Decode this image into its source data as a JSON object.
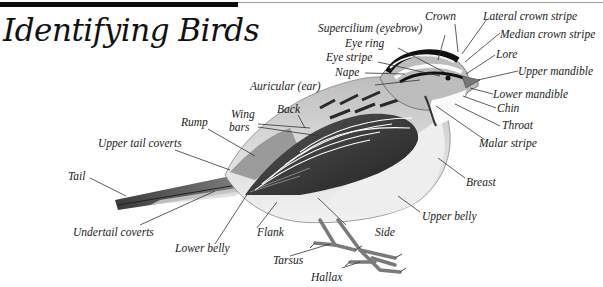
{
  "title": "Identifying Birds",
  "colors": {
    "rule": "#0a0a0a",
    "rule_thin": "#9a9a9a",
    "text": "#1a1a1a",
    "leader": "#333333"
  },
  "labels": {
    "crown": "Crown",
    "lateral_crown_stripe": "Lateral crown stripe",
    "supercilium": "Supercilium (eyebrow)",
    "median_crown_stripe": "Median crown stripe",
    "eye_ring": "Eye ring",
    "eye_stripe": "Eye stripe",
    "lore": "Lore",
    "nape": "Nape",
    "upper_mandible": "Upper mandible",
    "auricular": "Auricular (ear)",
    "lower_mandible": "Lower mandible",
    "chin": "Chin",
    "back": "Back",
    "wing_bars": "Wing bars",
    "rump": "Rump",
    "throat": "Throat",
    "malar_stripe": "Malar stripe",
    "upper_tail_coverts": "Upper tail coverts",
    "tail": "Tail",
    "breast": "Breast",
    "upper_belly": "Upper belly",
    "undertail_coverts": "Undertail coverts",
    "flank": "Flank",
    "side": "Side",
    "lower_belly": "Lower belly",
    "tarsus": "Tarsus",
    "hallax": "Hallax"
  },
  "wing_bars_lines": [
    "Wing",
    "bars"
  ]
}
